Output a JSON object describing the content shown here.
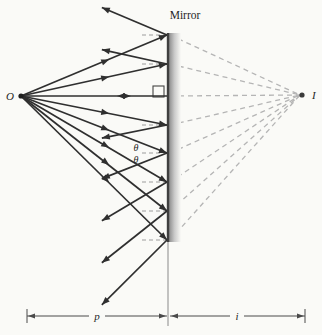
{
  "figure": {
    "title": "Mirror",
    "object_label": "O",
    "image_label": "I",
    "theta_incident": "θ",
    "theta_reflected": "θ",
    "object_distance_label": "p",
    "image_distance_label": "i"
  },
  "colors": {
    "background": "#fafaf7",
    "ray": "#2f2f2f",
    "virtual_ray": "#b5b5b5",
    "normal_stub": "#9c9c9c",
    "mirror_line": "#3f3f3f",
    "mirror_shade": "#8c8c8c",
    "dimension": "#4a4a4a",
    "dot": "#1f1f1f",
    "image_dot": "#3a3a3a"
  },
  "geometry": {
    "canvas": {
      "w": 322,
      "h": 335
    },
    "object": {
      "x": 21,
      "y": 96
    },
    "image": {
      "x": 302,
      "y": 95
    },
    "mirror": {
      "x": 168,
      "top": 33,
      "bottom": 242,
      "shade_w": 12,
      "stem_bottom": 326
    },
    "hits": [
      35,
      64,
      96,
      125,
      153,
      182,
      211,
      240
    ],
    "center_y": 96,
    "reflect_len_t": 0.45,
    "incident_arrow_t": 0.6,
    "normal_stub_len": 26,
    "square_size": 11,
    "dimension": {
      "y": 316,
      "left": 27,
      "right": 305,
      "tick_half": 7,
      "p_gap": [
        89,
        105
      ],
      "i_gap": [
        230,
        244
      ]
    }
  }
}
